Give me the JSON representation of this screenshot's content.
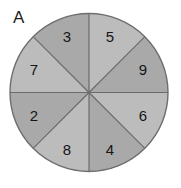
{
  "figure": {
    "panel_label": "A",
    "type": "spinner-wheel",
    "background_color": "#ffffff"
  },
  "spinner": {
    "center_x": 89,
    "center_y": 92.5,
    "radius": 79,
    "outline_color": "#6e6e6e",
    "outline_width": 1.4,
    "divider_color": "#6b6b6b",
    "divider_width": 1.2,
    "sector_count": 8,
    "sector_angle_degrees": 45,
    "fill_light": "#bcbcbc",
    "fill_dark": "#a9a9a9",
    "label_color": "#161616",
    "sectors": [
      {
        "label": "5",
        "start_angle": -90,
        "end_angle": -45,
        "fill": "#bcbcbc",
        "label_x": 110,
        "label_y": 38
      },
      {
        "label": "9",
        "start_angle": -45,
        "end_angle": 0,
        "fill": "#a9a9a9",
        "label_x": 143,
        "label_y": 71
      },
      {
        "label": "6",
        "start_angle": 0,
        "end_angle": 45,
        "fill": "#bcbcbc",
        "label_x": 143,
        "label_y": 117
      },
      {
        "label": "4",
        "start_angle": 45,
        "end_angle": 90,
        "fill": "#a9a9a9",
        "label_x": 110,
        "label_y": 151
      },
      {
        "label": "8",
        "start_angle": 90,
        "end_angle": 135,
        "fill": "#bcbcbc",
        "label_x": 67,
        "label_y": 151
      },
      {
        "label": "2",
        "start_angle": 135,
        "end_angle": 180,
        "fill": "#a9a9a9",
        "label_x": 34,
        "label_y": 117
      },
      {
        "label": "7",
        "start_angle": 180,
        "end_angle": 225,
        "fill": "#bcbcbc",
        "label_x": 34,
        "label_y": 71
      },
      {
        "label": "3",
        "start_angle": 225,
        "end_angle": 270,
        "fill": "#a9a9a9",
        "label_x": 67,
        "label_y": 38
      }
    ]
  }
}
